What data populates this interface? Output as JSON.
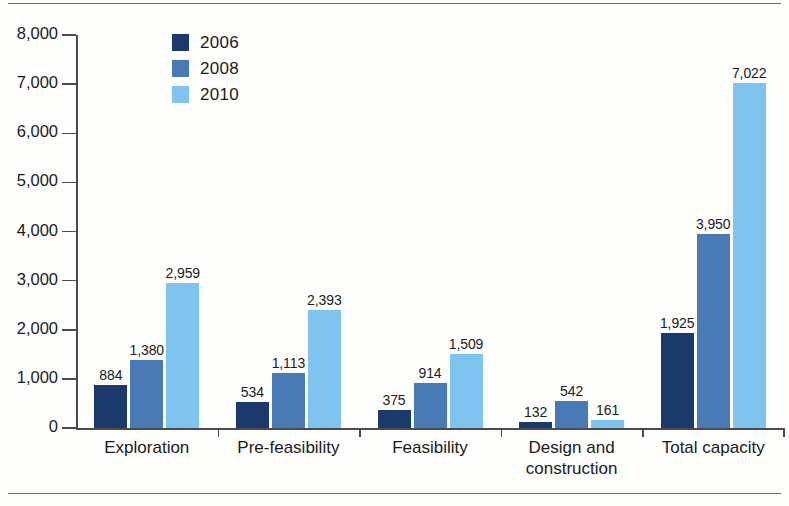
{
  "chart_data": {
    "type": "bar",
    "title": "",
    "subtitle": "",
    "xlabel": "",
    "ylabel": "",
    "categories": [
      "Exploration",
      "Pre-feasibility",
      "Feasibility",
      "Design and\nconstruction",
      "Total capacity"
    ],
    "series": [
      {
        "name": "2006",
        "color": "#1b3a6b",
        "values": [
          884,
          534,
          375,
          132,
          1925
        ],
        "labels": [
          "884",
          "534",
          "375",
          "132",
          "1,925"
        ]
      },
      {
        "name": "2008",
        "color": "#4a7ab5",
        "values": [
          1380,
          1113,
          914,
          542,
          3950
        ],
        "labels": [
          "1,380",
          "1,113",
          "914",
          "542",
          "3,950"
        ]
      },
      {
        "name": "2010",
        "color": "#7ec4ee",
        "values": [
          2959,
          2393,
          1509,
          161,
          7022
        ],
        "labels": [
          "2,959",
          "2,393",
          "1,509",
          "161",
          "7,022"
        ]
      }
    ],
    "ylim": [
      0,
      8000
    ],
    "ytick_values": [
      0,
      1000,
      2000,
      3000,
      4000,
      5000,
      6000,
      7000,
      8000
    ],
    "ytick_labels": [
      "0",
      "1,000",
      "2,000",
      "3,000",
      "4,000",
      "5,000",
      "6,000",
      "7,000",
      "8,000"
    ],
    "grid": false,
    "legend_position": "top-left-inside",
    "axis_color": "#4a4a4a",
    "text_color": "#1b1b1b",
    "background": "#fdfdfc"
  },
  "legend": {
    "items": [
      {
        "label": "2006",
        "color": "#1b3a6b"
      },
      {
        "label": "2008",
        "color": "#4a7ab5"
      },
      {
        "label": "2010",
        "color": "#7ec4ee"
      }
    ]
  }
}
